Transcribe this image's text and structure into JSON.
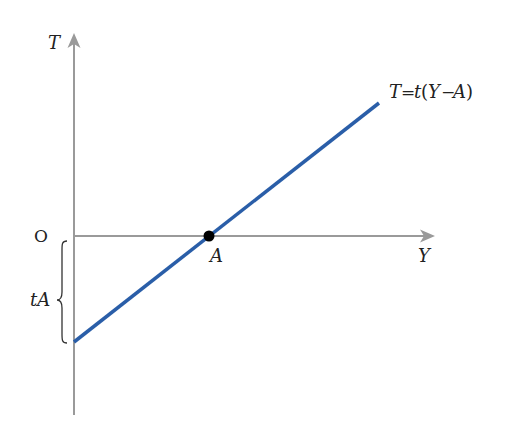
{
  "diagram": {
    "type": "linear-function-plot",
    "axes": {
      "y_axis_label": "T",
      "x_axis_label": "Y",
      "origin_label": "O",
      "axis_color": "#9a9a9a"
    },
    "line": {
      "equation_label": "T = t(Y − A)",
      "color": "#2a5ea8",
      "start": {
        "x": 74,
        "y": 342
      },
      "end": {
        "x": 379,
        "y": 103
      }
    },
    "point": {
      "label": "A",
      "x": 209,
      "y": 236,
      "color": "#000000"
    },
    "intercept": {
      "label": "tA",
      "brace_from_y": 240,
      "brace_to_y": 343
    }
  },
  "labels": {
    "T": "T",
    "Y": "Y",
    "O": "O",
    "A": "A",
    "tA": "tA",
    "eq_T": "T",
    "eq_eq": "=",
    "eq_t": "t",
    "eq_open": "(",
    "eq_Y": "Y",
    "eq_minus": "−",
    "eq_A": "A",
    "eq_close": ")"
  }
}
